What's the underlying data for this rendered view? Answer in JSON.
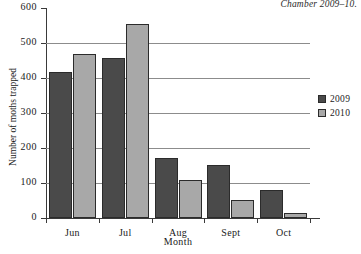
{
  "caption": "Chamber 2009–10.",
  "chart_data": {
    "type": "bar",
    "title": "",
    "xlabel": "Month",
    "ylabel": "Number of moths trapped",
    "categories": [
      "Jun",
      "Jul",
      "Aug",
      "Sept",
      "Oct"
    ],
    "series": [
      {
        "name": "2009",
        "color": "#4a4a4a",
        "values": [
          417,
          458,
          171,
          151,
          80
        ]
      },
      {
        "name": "2010",
        "color": "#a8a8a8",
        "values": [
          470,
          553,
          109,
          51,
          15
        ]
      }
    ],
    "ylim": [
      0,
      600
    ],
    "yticks": [
      0,
      100,
      200,
      300,
      400,
      500,
      600
    ],
    "ytick_labels": [
      "0",
      "100",
      "200",
      "300",
      "400",
      "500",
      "600"
    ],
    "grid": "horizontal",
    "legend_position": "right",
    "legend_entries": [
      "2009",
      "2010"
    ]
  }
}
